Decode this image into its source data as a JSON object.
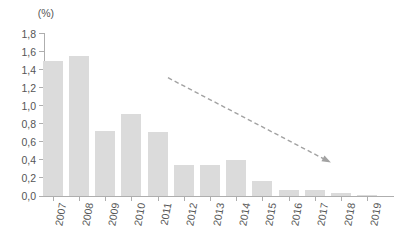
{
  "chart_data": {
    "type": "bar",
    "title": "",
    "xlabel": "",
    "ylabel": "(%)",
    "categories": [
      "2007",
      "2008",
      "2009",
      "2010",
      "2011",
      "2012",
      "2013",
      "2014",
      "2015",
      "2016",
      "2017",
      "2018",
      "2019"
    ],
    "values": [
      1.5,
      1.55,
      0.72,
      0.91,
      0.71,
      0.34,
      0.34,
      0.4,
      0.17,
      0.07,
      0.07,
      0.03,
      0.01
    ],
    "ylim": [
      0,
      1.8
    ],
    "ytick_step": 0.2,
    "ytick_labels": [
      "0,0",
      "0,2",
      "0,4",
      "0,6",
      "0,8",
      "1,0",
      "1,2",
      "1,4",
      "1,6",
      "1,8"
    ],
    "grid": false,
    "legend": "none",
    "decimal_separator": ",",
    "bar_color": "#dbdbdb",
    "axis_color": "#aeaeae",
    "text_color": "#555555",
    "annotations": [
      {
        "type": "dashed-arrow",
        "meaning": "declining trend",
        "color": "#a2a2a2",
        "from": {
          "x_index": 4.4,
          "value": 1.31
        },
        "to": {
          "x_index": 10.62,
          "value": 0.37
        }
      }
    ]
  }
}
